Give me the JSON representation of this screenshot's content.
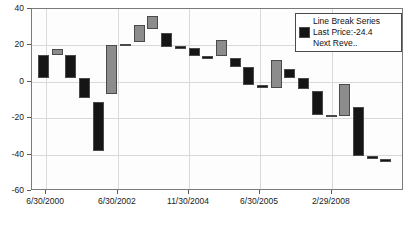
{
  "chart_data": {
    "type": "bar",
    "subtype": "three-line-break",
    "title": "",
    "xlabel": "",
    "ylabel": "",
    "ylim": [
      -60,
      40
    ],
    "yticks": [
      40,
      20,
      0,
      -20,
      -40,
      -60
    ],
    "ytick_labels": [
      "40",
      "20",
      "0",
      "-20",
      "-40",
      "-60"
    ],
    "grid": true,
    "legend_position": "top-right",
    "xtick_labels": [
      "6/30/2000",
      "6/30/2002",
      "11/30/2004",
      "6/30/2005",
      "2/29/2008"
    ],
    "xtick_positions_pct": [
      3.8,
      23.1,
      42.2,
      61.3,
      80.6
    ],
    "series_name": "Line Break Series",
    "colors": {
      "up_block": "#8c8c8c",
      "down_block": "#151515",
      "block_border": "#4a4a4a",
      "grid": "#d9d9d9",
      "axis": "#7a7a7a",
      "text": "#111111",
      "plot_background": "#fdfdfd"
    },
    "blocks": [
      {
        "index": 1,
        "open": 2.0,
        "close": 15.0,
        "direction": "down"
      },
      {
        "index": 2,
        "open": 15.0,
        "close": 18.0,
        "direction": "up"
      },
      {
        "index": 3,
        "open": 2.0,
        "close": 15.0,
        "direction": "down"
      },
      {
        "index": 4,
        "open": -9.0,
        "close": 2.0,
        "direction": "down"
      },
      {
        "index": 5,
        "open": -38.0,
        "close": -11.0,
        "direction": "down"
      },
      {
        "index": 6,
        "open": -7.0,
        "close": 20.0,
        "direction": "up"
      },
      {
        "index": 7,
        "open": 20.0,
        "close": 21.0,
        "direction": "up"
      },
      {
        "index": 8,
        "open": 22.0,
        "close": 31.0,
        "direction": "up"
      },
      {
        "index": 9,
        "open": 29.0,
        "close": 36.0,
        "direction": "up"
      },
      {
        "index": 10,
        "open": 19.0,
        "close": 27.0,
        "direction": "down"
      },
      {
        "index": 11,
        "open": 18.5,
        "close": 19.5,
        "direction": "down"
      },
      {
        "index": 12,
        "open": 14.0,
        "close": 18.5,
        "direction": "down"
      },
      {
        "index": 13,
        "open": 13.0,
        "close": 14.0,
        "direction": "down"
      },
      {
        "index": 14,
        "open": 14.0,
        "close": 23.0,
        "direction": "up"
      },
      {
        "index": 15,
        "open": 8.0,
        "close": 13.0,
        "direction": "down"
      },
      {
        "index": 16,
        "open": -2.0,
        "close": 8.0,
        "direction": "down"
      },
      {
        "index": 17,
        "open": -3.5,
        "close": -2.0,
        "direction": "down"
      },
      {
        "index": 18,
        "open": -3.5,
        "close": 12.0,
        "direction": "up"
      },
      {
        "index": 19,
        "open": 2.0,
        "close": 7.0,
        "direction": "down"
      },
      {
        "index": 20,
        "open": -4.0,
        "close": 2.0,
        "direction": "down"
      },
      {
        "index": 21,
        "open": -18.0,
        "close": -5.0,
        "direction": "down"
      },
      {
        "index": 22,
        "open": -19.0,
        "close": -18.0,
        "direction": "down"
      },
      {
        "index": 23,
        "open": -19.0,
        "close": -1.0,
        "direction": "up"
      },
      {
        "index": 24,
        "open": -41.0,
        "close": -14.0,
        "direction": "down"
      },
      {
        "index": 25,
        "open": -42.5,
        "close": -41.0,
        "direction": "down"
      },
      {
        "index": 26,
        "open": -43.0,
        "close": -42.5,
        "direction": "down"
      }
    ],
    "legend": {
      "lines": [
        "Line Break Series",
        "Last Price:-24.4",
        "Next Reve.."
      ],
      "swatch_color": "#151515"
    },
    "annotations": {
      "last_price": -24.4
    }
  }
}
